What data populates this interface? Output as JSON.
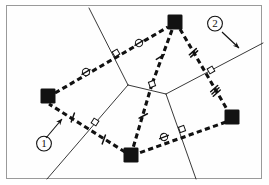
{
  "figure": {
    "title": "",
    "type": "geometric-diagram",
    "background_color": "#ffffff",
    "frame": {
      "border_color": "#9a9a9a",
      "x": 6,
      "y": 5,
      "width": 256,
      "height": 174
    },
    "colors": {
      "node_fill": "#121212",
      "dashed_edge": "#111111",
      "thin_line": "#222222",
      "label_text": "#111111",
      "marker_stroke": "#111111",
      "marker_fill": "#ffffff"
    }
  },
  "annotations": [
    {
      "id": "callout-1",
      "label": "①",
      "label_x": 44,
      "label_y": 147,
      "arrow_from_x": 46,
      "arrow_from_y": 138,
      "arrow_to_x": 62,
      "arrow_to_y": 119,
      "points_to": "tick-mark-on-lower-left-dashed-edge"
    },
    {
      "id": "callout-2",
      "label": "②",
      "label_x": 215,
      "label_y": 27,
      "arrow_from_x": 222,
      "arrow_from_y": 32,
      "arrow_to_x": 239,
      "arrow_to_y": 48,
      "points_to": "thin-solid-network-line"
    }
  ],
  "nodes": [
    {
      "id": "node-top",
      "name": "filled-square-node-top",
      "x": 175,
      "y": 22,
      "size": 15
    },
    {
      "id": "node-left",
      "name": "filled-square-node-left",
      "x": 48,
      "y": 96,
      "size": 15
    },
    {
      "id": "node-bottom",
      "name": "filled-square-node-bottom",
      "x": 131,
      "y": 155,
      "size": 15
    },
    {
      "id": "node-right",
      "name": "filled-square-node-right",
      "x": 232,
      "y": 117,
      "size": 15
    }
  ],
  "center_point": {
    "id": "hub",
    "x": 152,
    "y": 84
  },
  "dashed_edges": [
    {
      "id": "edge-left-top",
      "from": "node-left",
      "to": "node-top",
      "x1": 55,
      "y1": 93,
      "x2": 168,
      "y2": 27,
      "markers": "circle-slash-x2"
    },
    {
      "id": "edge-top-right",
      "from": "node-top",
      "to": "node-right",
      "x1": 180,
      "y1": 29,
      "x2": 228,
      "y2": 111,
      "markers": "tick-x2-and-tick-x3"
    },
    {
      "id": "edge-right-bottom",
      "from": "node-right",
      "to": "node-bottom",
      "x1": 226,
      "y1": 122,
      "x2": 139,
      "y2": 153,
      "markers": "circle-slash-x1"
    },
    {
      "id": "edge-bottom-left",
      "from": "node-bottom",
      "to": "node-left",
      "x1": 125,
      "y1": 152,
      "x2": 49,
      "y2": 104,
      "markers": "tick-x2"
    },
    {
      "id": "edge-top-hub",
      "from": "node-top",
      "to": "hub",
      "x1": 172,
      "y1": 30,
      "x2": 152,
      "y2": 84,
      "markers": "tick-x1"
    },
    {
      "id": "edge-hub-bottom",
      "from": "hub",
      "to": "node-bottom",
      "x1": 152,
      "y1": 84,
      "x2": 133,
      "y2": 148,
      "markers": "tick-x1"
    }
  ],
  "thin_lines": [
    {
      "id": "thin-line-a",
      "x1": 89,
      "y1": 8,
      "x2": 128,
      "y2": 85,
      "desc": "upper-left-to-center"
    },
    {
      "id": "thin-line-b",
      "x1": 128,
      "y1": 85,
      "x2": 47,
      "y2": 179,
      "desc": "center-to-lower-left"
    },
    {
      "id": "thin-line-c",
      "x1": 128,
      "y1": 85,
      "x2": 166,
      "y2": 94,
      "desc": "center-to-hub-area"
    },
    {
      "id": "thin-line-d",
      "x1": 166,
      "y1": 94,
      "x2": 263,
      "y2": 43,
      "desc": "hub-area-to-upper-right"
    },
    {
      "id": "thin-line-e",
      "x1": 166,
      "y1": 94,
      "x2": 196,
      "y2": 179,
      "desc": "hub-area-to-lower-right"
    }
  ],
  "tick_markers": [
    {
      "id": "tick-1",
      "type": "single",
      "x": 160,
      "y": 56,
      "angle": 70,
      "on": "edge-top-hub"
    },
    {
      "id": "tick-2",
      "type": "single",
      "x": 143,
      "y": 115,
      "angle": 74,
      "on": "edge-hub-bottom"
    },
    {
      "id": "tick-3",
      "type": "double",
      "x": 193,
      "y": 52,
      "angle": 60,
      "on": "edge-top-right"
    },
    {
      "id": "tick-4",
      "type": "triple",
      "x": 215,
      "y": 90,
      "angle": 60,
      "on": "edge-top-right"
    },
    {
      "id": "tick-5",
      "type": "single",
      "x": 72,
      "y": 117,
      "angle": 32,
      "on": "edge-bottom-left"
    },
    {
      "id": "tick-6",
      "type": "single",
      "x": 103,
      "y": 139,
      "angle": 32,
      "on": "edge-bottom-left"
    }
  ],
  "circle_markers": [
    {
      "id": "circ-1",
      "x": 86,
      "y": 72,
      "angle": -30,
      "on": "edge-left-top"
    },
    {
      "id": "circ-2",
      "x": 139,
      "y": 43,
      "angle": -30,
      "on": "edge-left-top"
    },
    {
      "id": "circ-3",
      "x": 164,
      "y": 137,
      "angle": -20,
      "on": "edge-right-bottom"
    }
  ],
  "square_markers": [
    {
      "id": "sq-1",
      "x": 116,
      "y": 53,
      "angle": -30,
      "desc": "crossing-thin-line-a"
    },
    {
      "id": "sq-2",
      "x": 152,
      "y": 84,
      "angle": 70,
      "desc": "hub-crossing"
    },
    {
      "id": "sq-3",
      "x": 211,
      "y": 70,
      "angle": 60,
      "desc": "crossing-thin-line-d"
    },
    {
      "id": "sq-4",
      "x": 182,
      "y": 129,
      "angle": -20,
      "desc": "crossing-thin-line-e"
    },
    {
      "id": "sq-5",
      "x": 95,
      "y": 122,
      "angle": 32,
      "desc": "crossing-thin-line-b"
    }
  ]
}
